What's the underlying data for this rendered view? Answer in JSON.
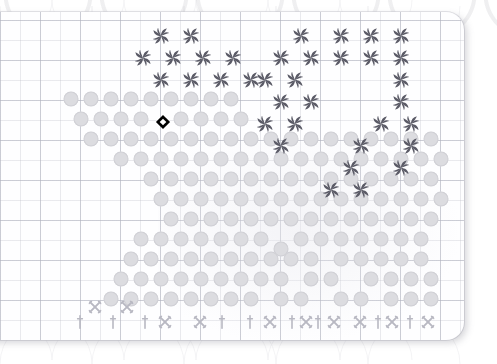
{
  "board": {
    "title": "Grid Map Board",
    "grid": {
      "minor_cell_px": 20,
      "major_cell_px": 40,
      "origin_x": 12,
      "origin_y": 8,
      "line_color_minor": "#babac6",
      "line_color_major": "#b0b2be"
    },
    "card": {
      "background": "#fefeff",
      "corner_radius_px": 18,
      "shadow_color": "#787884"
    },
    "legend": {
      "dot": "terrain-dot",
      "whirl": "pinwheel-unit",
      "xmark": "crossed-swords-marker",
      "dagger": "sword-marker",
      "cursor": "selected-cell-cursor"
    },
    "colors": {
      "dot": "#dcdce0",
      "whirl": "#5a5a66",
      "marker": "#b8b8c2",
      "cursor": "#000000",
      "cursor_center": "#ffffff"
    }
  },
  "cursor": {
    "label": "selected cell",
    "x": 163,
    "y": 122
  },
  "dots": [
    [
      71,
      99
    ],
    [
      91,
      99
    ],
    [
      111,
      99
    ],
    [
      131,
      99
    ],
    [
      151,
      99
    ],
    [
      171,
      99
    ],
    [
      191,
      99
    ],
    [
      211,
      99
    ],
    [
      231,
      99
    ],
    [
      81,
      119
    ],
    [
      101,
      119
    ],
    [
      121,
      119
    ],
    [
      141,
      119
    ],
    [
      181,
      119
    ],
    [
      201,
      119
    ],
    [
      221,
      119
    ],
    [
      241,
      119
    ],
    [
      91,
      139
    ],
    [
      111,
      139
    ],
    [
      131,
      139
    ],
    [
      151,
      139
    ],
    [
      171,
      139
    ],
    [
      191,
      139
    ],
    [
      211,
      139
    ],
    [
      231,
      139
    ],
    [
      251,
      139
    ],
    [
      271,
      139
    ],
    [
      291,
      139
    ],
    [
      311,
      139
    ],
    [
      331,
      139
    ],
    [
      351,
      139
    ],
    [
      371,
      139
    ],
    [
      391,
      139
    ],
    [
      411,
      139
    ],
    [
      431,
      139
    ],
    [
      121,
      159
    ],
    [
      141,
      159
    ],
    [
      161,
      159
    ],
    [
      181,
      159
    ],
    [
      201,
      159
    ],
    [
      221,
      159
    ],
    [
      241,
      159
    ],
    [
      261,
      159
    ],
    [
      281,
      159
    ],
    [
      301,
      159
    ],
    [
      321,
      159
    ],
    [
      341,
      159
    ],
    [
      361,
      159
    ],
    [
      381,
      159
    ],
    [
      401,
      159
    ],
    [
      421,
      159
    ],
    [
      441,
      159
    ],
    [
      151,
      179
    ],
    [
      171,
      179
    ],
    [
      191,
      179
    ],
    [
      211,
      179
    ],
    [
      231,
      179
    ],
    [
      251,
      179
    ],
    [
      271,
      179
    ],
    [
      291,
      179
    ],
    [
      311,
      179
    ],
    [
      331,
      179
    ],
    [
      351,
      179
    ],
    [
      371,
      179
    ],
    [
      391,
      179
    ],
    [
      411,
      179
    ],
    [
      431,
      179
    ],
    [
      161,
      199
    ],
    [
      181,
      199
    ],
    [
      201,
      199
    ],
    [
      221,
      199
    ],
    [
      241,
      199
    ],
    [
      261,
      199
    ],
    [
      281,
      199
    ],
    [
      301,
      199
    ],
    [
      321,
      199
    ],
    [
      341,
      199
    ],
    [
      361,
      199
    ],
    [
      381,
      199
    ],
    [
      401,
      199
    ],
    [
      421,
      199
    ],
    [
      441,
      199
    ],
    [
      171,
      219
    ],
    [
      191,
      219
    ],
    [
      211,
      219
    ],
    [
      231,
      219
    ],
    [
      251,
      219
    ],
    [
      271,
      219
    ],
    [
      291,
      219
    ],
    [
      311,
      219
    ],
    [
      331,
      219
    ],
    [
      351,
      219
    ],
    [
      371,
      219
    ],
    [
      391,
      219
    ],
    [
      411,
      219
    ],
    [
      431,
      219
    ],
    [
      141,
      239
    ],
    [
      161,
      239
    ],
    [
      181,
      239
    ],
    [
      201,
      239
    ],
    [
      221,
      239
    ],
    [
      241,
      239
    ],
    [
      261,
      239
    ],
    [
      281,
      249
    ],
    [
      301,
      239
    ],
    [
      321,
      239
    ],
    [
      341,
      239
    ],
    [
      361,
      239
    ],
    [
      381,
      239
    ],
    [
      401,
      239
    ],
    [
      421,
      239
    ],
    [
      131,
      259
    ],
    [
      151,
      259
    ],
    [
      171,
      259
    ],
    [
      191,
      259
    ],
    [
      211,
      259
    ],
    [
      231,
      259
    ],
    [
      251,
      259
    ],
    [
      271,
      259
    ],
    [
      291,
      259
    ],
    [
      311,
      259
    ],
    [
      341,
      259
    ],
    [
      361,
      259
    ],
    [
      381,
      259
    ],
    [
      401,
      259
    ],
    [
      421,
      259
    ],
    [
      121,
      279
    ],
    [
      141,
      279
    ],
    [
      161,
      279
    ],
    [
      181,
      279
    ],
    [
      201,
      279
    ],
    [
      221,
      279
    ],
    [
      241,
      279
    ],
    [
      261,
      279
    ],
    [
      281,
      279
    ],
    [
      311,
      279
    ],
    [
      331,
      279
    ],
    [
      371,
      279
    ],
    [
      391,
      279
    ],
    [
      411,
      279
    ],
    [
      431,
      279
    ],
    [
      111,
      299
    ],
    [
      131,
      299
    ],
    [
      151,
      299
    ],
    [
      171,
      299
    ],
    [
      191,
      299
    ],
    [
      211,
      299
    ],
    [
      231,
      299
    ],
    [
      251,
      299
    ],
    [
      281,
      299
    ],
    [
      301,
      299
    ],
    [
      341,
      299
    ],
    [
      361,
      299
    ],
    [
      391,
      299
    ],
    [
      411,
      299
    ],
    [
      431,
      299
    ]
  ],
  "whirls": [
    [
      161,
      36
    ],
    [
      191,
      36
    ],
    [
      301,
      36
    ],
    [
      341,
      36
    ],
    [
      371,
      36
    ],
    [
      401,
      36
    ],
    [
      143,
      58
    ],
    [
      173,
      58
    ],
    [
      203,
      58
    ],
    [
      233,
      58
    ],
    [
      281,
      58
    ],
    [
      311,
      58
    ],
    [
      341,
      58
    ],
    [
      371,
      58
    ],
    [
      401,
      58
    ],
    [
      161,
      80
    ],
    [
      191,
      80
    ],
    [
      221,
      80
    ],
    [
      251,
      80
    ],
    [
      265,
      80
    ],
    [
      295,
      80
    ],
    [
      401,
      80
    ],
    [
      281,
      102
    ],
    [
      311,
      102
    ],
    [
      401,
      102
    ],
    [
      381,
      124
    ],
    [
      411,
      124
    ],
    [
      265,
      124
    ],
    [
      295,
      124
    ],
    [
      281,
      146
    ],
    [
      361,
      146
    ],
    [
      411,
      146
    ],
    [
      351,
      168
    ],
    [
      401,
      168
    ],
    [
      331,
      190
    ],
    [
      361,
      190
    ]
  ],
  "xmarks": [
    [
      95,
      307
    ],
    [
      127,
      307
    ],
    [
      165,
      322
    ],
    [
      200,
      322
    ],
    [
      270,
      322
    ],
    [
      306,
      322
    ],
    [
      334,
      322
    ],
    [
      360,
      322
    ],
    [
      392,
      322
    ],
    [
      428,
      322
    ]
  ],
  "daggers": [
    [
      80,
      322
    ],
    [
      113,
      322
    ],
    [
      145,
      322
    ],
    [
      222,
      322
    ],
    [
      250,
      322
    ],
    [
      292,
      322
    ],
    [
      318,
      322
    ],
    [
      378,
      322
    ],
    [
      410,
      322
    ]
  ],
  "status": {
    "visible_tokens_label": "",
    "note": ""
  }
}
